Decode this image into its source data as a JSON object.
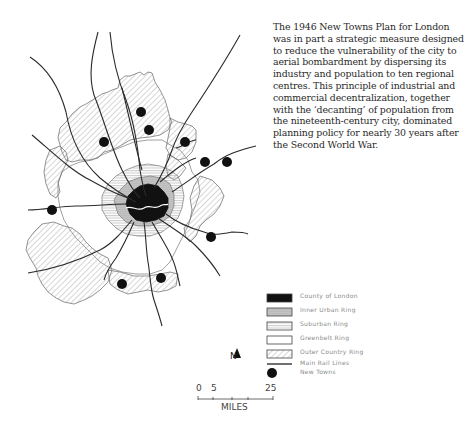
{
  "caption": {
    "lines": [
      "The 1946 New Towns Plan for London",
      "was in part a strategic measure designed",
      "to reduce the vulnerability of the city to",
      "aerial bombardment by dispersing its",
      "industry and population to ten regional",
      "centres. This principle of industrial and",
      "commercial decentralization, together",
      "with the ‘decanting’ of population from",
      "the nineteenth-century city, dominated",
      "planning policy for nearly 30 years after",
      "the Second World War."
    ]
  },
  "legend": {
    "items": [
      {
        "label": "County of London",
        "symbol": "solid-black"
      },
      {
        "label": "Inner Urban Ring",
        "symbol": "dark-stipple"
      },
      {
        "label": "Suburban Ring",
        "symbol": "horizontal-lines"
      },
      {
        "label": "Greenbelt Ring",
        "symbol": "blank"
      },
      {
        "label": "Outer Country Ring",
        "symbol": "diagonal-hatch"
      },
      {
        "label": "Main Rail Lines",
        "symbol": "line"
      },
      {
        "label": "New Towns",
        "symbol": "dot"
      }
    ]
  },
  "north_arrow": {
    "label": "N"
  },
  "scale_bar": {
    "ticks": [
      "0",
      "5",
      "25"
    ],
    "unit": "MILES"
  },
  "map": {
    "new_towns_count": 10,
    "colors": {
      "ink": "#1a1a1a",
      "hatch": "#9a9a9a",
      "paper": "#ffffff"
    }
  }
}
